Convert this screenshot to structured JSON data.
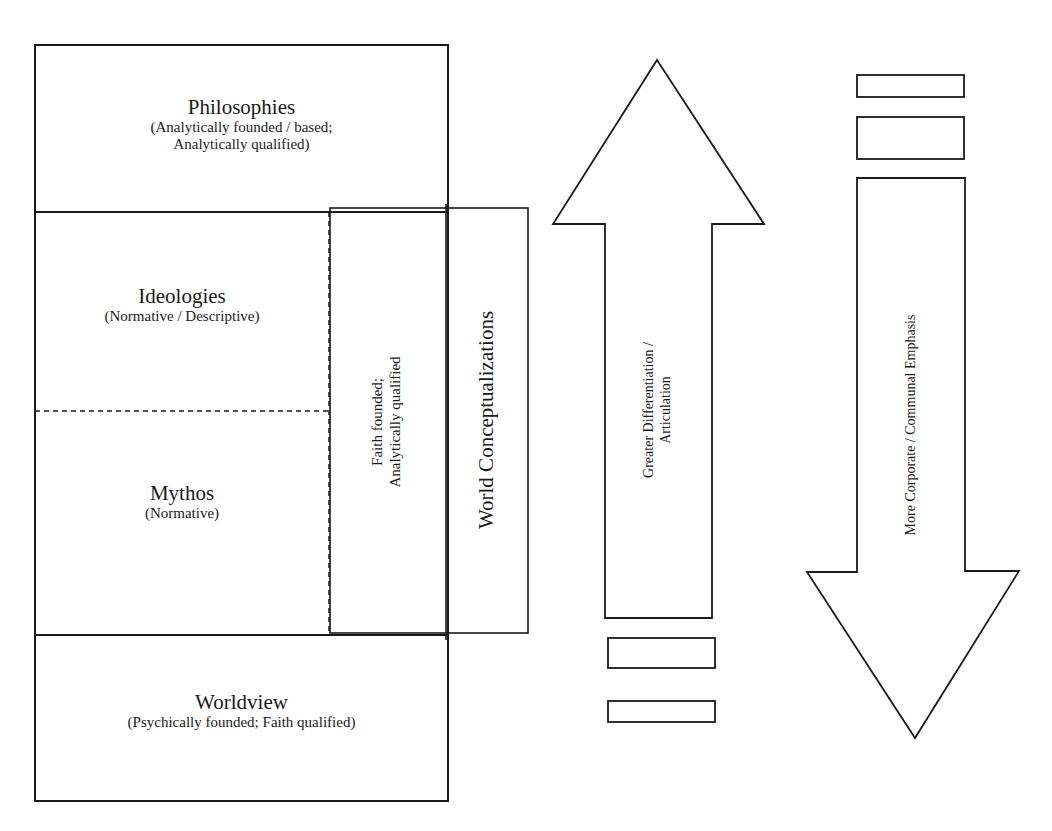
{
  "diagram": {
    "blocks": {
      "philosophies": {
        "title": "Philosophies",
        "subtitle_line1": "(Analytically founded / based;",
        "subtitle_line2": "Analytically qualified)"
      },
      "ideologies": {
        "title": "Ideologies",
        "subtitle": "(Normative / Descriptive)"
      },
      "mythos": {
        "title": "Mythos",
        "subtitle": "(Normative)"
      },
      "worldview": {
        "title": "Worldview",
        "subtitle": "(Psychically founded; Faith qualified)"
      }
    },
    "faith_column": {
      "line1": "Faith founded;",
      "line2": "Analytically qualified"
    },
    "world_conceptualizations": {
      "label": "World Conceptualizations"
    },
    "up_arrow": {
      "line1": "Greater Differentiation /",
      "line2": "Articulation"
    },
    "down_arrow": {
      "label": "More Corporate / Communal Emphasis"
    },
    "colors": {
      "stroke": "#1a1a1a",
      "fill": "#ffffff"
    }
  }
}
